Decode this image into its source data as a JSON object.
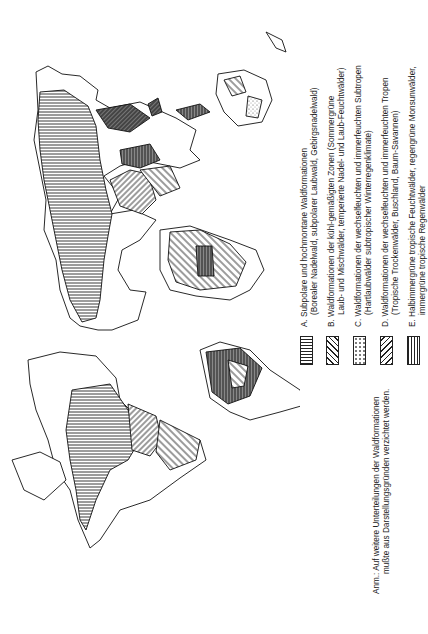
{
  "map": {
    "orientation": "rotated 90° counterclockwise",
    "subject": "World map of forest formations"
  },
  "legend": {
    "items": [
      {
        "key": "A",
        "line1": "A.  Subpolare und hochmontane Waldformationen",
        "line2": "(Borealer Nadelwald, subpolarer Laubwald, Gebirgsnadelwald)",
        "pattern": "horizontal-lines"
      },
      {
        "key": "B",
        "line1": "B.  Waldformationen der kühl-gemäßigten Zonen (Sommergrüne",
        "line2": "Laub- und Mischwälder, temperierte Nadel- und Laub-Feuchtwälder)",
        "pattern": "diagonal-lines-right"
      },
      {
        "key": "C",
        "line1": "C.  Waldformationen der wechselfeuchten und immerfeuchten Subtropen",
        "line2": "(Hartlaubwälder subtropischer Winterregenklimate)",
        "pattern": "dots"
      },
      {
        "key": "D",
        "line1": "D.  Waldformationen der wechselfeuchten und immerfeuchten Tropen",
        "line2": "(Tropische Trockenwälder, Buschland, Baum-Savannen)",
        "pattern": "diagonal-lines-left"
      },
      {
        "key": "E",
        "line1": "E.  Halbimmergrüne tropische Feuchtwälder, regengrüne Monsunwälder,",
        "line2": "immergrüne tropische Regenwälder",
        "pattern": "vertical-lines"
      }
    ]
  },
  "note": {
    "line1": "Anm.: Auf weitere Unterteilungen der Waldformationen",
    "line2": "mußte aus Darstellungsgründen verzichtet werden."
  }
}
